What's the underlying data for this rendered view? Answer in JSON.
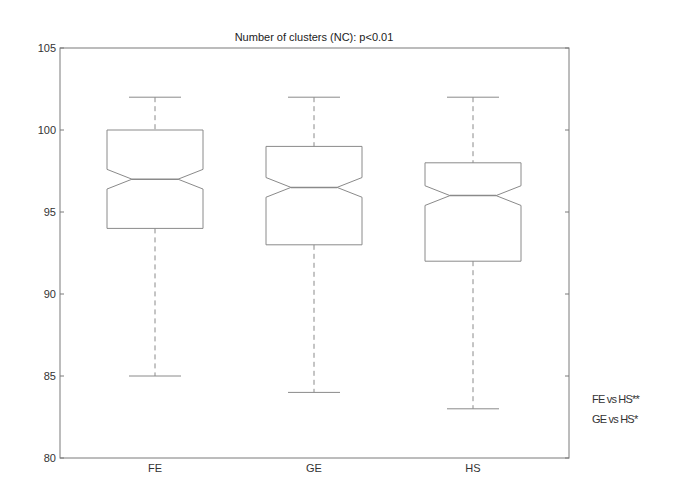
{
  "chart_data": {
    "type": "boxplot",
    "title": "Number of clusters (NC): p<0.01",
    "xlabel": "",
    "ylabel": "",
    "ylim": [
      80,
      105
    ],
    "yticks": [
      80,
      85,
      90,
      95,
      100,
      105
    ],
    "grid": false,
    "notched": true,
    "categories": [
      "FE",
      "GE",
      "HS"
    ],
    "series": [
      {
        "name": "FE",
        "whisker_low": 85,
        "q1": 94,
        "median": 97,
        "q3": 100,
        "whisker_high": 102,
        "notch_low": 96.4,
        "notch_high": 97.6
      },
      {
        "name": "GE",
        "whisker_low": 84,
        "q1": 93,
        "median": 96.5,
        "q3": 99,
        "whisker_high": 102,
        "notch_low": 95.9,
        "notch_high": 97.1
      },
      {
        "name": "HS",
        "whisker_low": 83,
        "q1": 92,
        "median": 96,
        "q3": 98,
        "whisker_high": 102,
        "notch_low": 95.4,
        "notch_high": 96.6
      }
    ],
    "annotations": [
      "FE vs HS**",
      "GE vs HS*"
    ]
  },
  "labels": {
    "title": "Number of clusters (NC): p<0.01",
    "annot1": "FE vs HS**",
    "annot2": "GE vs HS*"
  },
  "style": {
    "line_color": "#8a8a8a",
    "axis_color": "#7a7a7a",
    "background": "#ffffff"
  }
}
